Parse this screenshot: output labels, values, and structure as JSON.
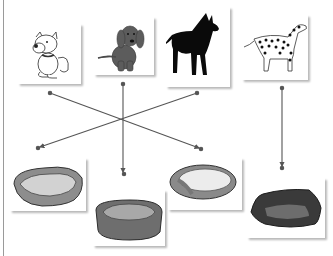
{
  "worksheet": {
    "task": "match dogs to beds",
    "dogs": [
      {
        "id": "dog-1",
        "name": "white cartoon dog",
        "icon": "white-cartoon-dog-icon"
      },
      {
        "id": "dog-2",
        "name": "brown puppy",
        "icon": "brown-puppy-icon"
      },
      {
        "id": "dog-3",
        "name": "great dane silhouette",
        "icon": "great-dane-icon"
      },
      {
        "id": "dog-4",
        "name": "dalmatian",
        "icon": "dalmatian-icon"
      }
    ],
    "beds": [
      {
        "id": "bed-1",
        "name": "oval bed light",
        "icon": "oval-bed-icon"
      },
      {
        "id": "bed-2",
        "name": "round bed medium",
        "icon": "round-bed-icon"
      },
      {
        "id": "bed-3",
        "name": "oval cushion bed",
        "icon": "cushion-bed-icon"
      },
      {
        "id": "bed-4",
        "name": "square dark bed",
        "icon": "square-bed-icon"
      }
    ],
    "matches": [
      {
        "from": "dog-1",
        "to": "bed-3"
      },
      {
        "from": "dog-2",
        "to": "bed-2"
      },
      {
        "from": "dog-3",
        "to": "bed-1"
      },
      {
        "from": "dog-4",
        "to": "bed-4"
      }
    ],
    "colors": {
      "line": "#555555",
      "card": "#ffffff",
      "border": "#9a9a9a"
    }
  }
}
